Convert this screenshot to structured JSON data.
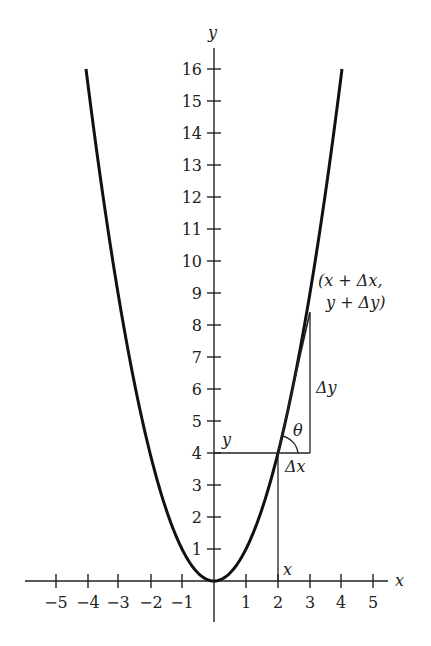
{
  "chart_data": {
    "type": "line",
    "title": "",
    "xlabel": "x",
    "ylabel": "y",
    "function": "y = x^2",
    "xlim": [
      -5.5,
      5.5
    ],
    "ylim": [
      0,
      16
    ],
    "x_ticks": [
      -5,
      -4,
      -3,
      -2,
      -1,
      1,
      2,
      3,
      4,
      5
    ],
    "x_tick_labels": [
      "−5",
      "−4",
      "−3",
      "−2",
      "−1",
      "1",
      "2",
      "3",
      "4",
      "5"
    ],
    "y_ticks": [
      1,
      2,
      3,
      4,
      5,
      6,
      7,
      8,
      9,
      10,
      11,
      12,
      13,
      14,
      15,
      16
    ],
    "y_tick_labels": [
      "1",
      "2",
      "3",
      "4",
      "5",
      "6",
      "7",
      "8",
      "9",
      "10",
      "11",
      "12",
      "13",
      "14",
      "15",
      "16"
    ],
    "series": [
      {
        "name": "parabola",
        "x": [
          -4,
          -3,
          -2,
          -1,
          0,
          1,
          2,
          3,
          4
        ],
        "y": [
          16,
          9,
          4,
          1,
          0,
          1,
          4,
          9,
          16
        ]
      },
      {
        "name": "secant",
        "x": [
          2,
          3
        ],
        "y": [
          4,
          8.4
        ]
      }
    ],
    "grid": false,
    "legend": null,
    "annotations": [
      {
        "text": "y",
        "at": [
          0.3,
          4.4
        ]
      },
      {
        "text": "x",
        "at": [
          2.1,
          0.4
        ]
      },
      {
        "text": "Δx",
        "at": [
          2.3,
          3.5
        ]
      },
      {
        "text": "Δy",
        "at": [
          3.1,
          6.1
        ]
      },
      {
        "text": "θ",
        "at": [
          2.8,
          4.7
        ]
      },
      {
        "text": "(x + Δx,",
        "at": [
          3.2,
          9.6
        ]
      },
      {
        "text": "y + Δy)",
        "at": [
          3.4,
          8.9
        ]
      }
    ]
  },
  "labels": {
    "x_axis": "x",
    "y_axis": "y",
    "y_segment": "y",
    "x_segment": "x",
    "delta_x": "Δx",
    "delta_y": "Δy",
    "theta": "θ",
    "point_line1": "(x + Δx,",
    "point_line2": "y + Δy)"
  },
  "x_ticks": [
    {
      "label": "−5",
      "px": 56
    },
    {
      "label": "−4",
      "px": 88
    },
    {
      "label": "−3",
      "px": 118
    },
    {
      "label": "−2",
      "px": 151
    },
    {
      "label": "−1",
      "px": 182
    },
    {
      "label": "1",
      "px": 246
    },
    {
      "label": "2",
      "px": 278
    },
    {
      "label": "3",
      "px": 310
    },
    {
      "label": "4",
      "px": 341
    },
    {
      "label": "5",
      "px": 373
    }
  ],
  "y_ticks": [
    {
      "label": "1",
      "v": 1
    },
    {
      "label": "2",
      "v": 2
    },
    {
      "label": "3",
      "v": 3
    },
    {
      "label": "4",
      "v": 4
    },
    {
      "label": "5",
      "v": 5
    },
    {
      "label": "6",
      "v": 6
    },
    {
      "label": "7",
      "v": 7
    },
    {
      "label": "8",
      "v": 8
    },
    {
      "label": "9",
      "v": 9
    },
    {
      "label": "10",
      "v": 10
    },
    {
      "label": "11",
      "v": 11
    },
    {
      "label": "12",
      "v": 12
    },
    {
      "label": "13",
      "v": 13
    },
    {
      "label": "14",
      "v": 14
    },
    {
      "label": "15",
      "v": 15
    },
    {
      "label": "16",
      "v": 16
    }
  ]
}
